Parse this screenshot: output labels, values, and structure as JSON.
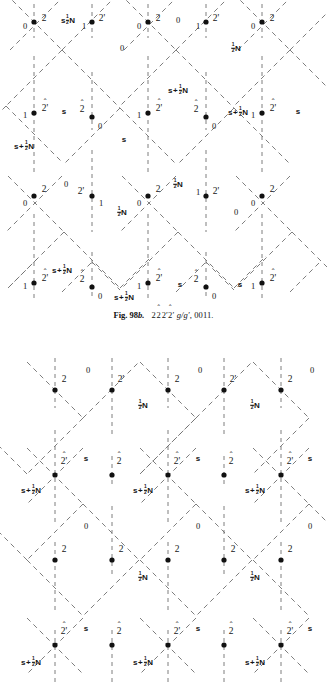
{
  "page": {
    "width": 327,
    "height": 682,
    "background": "#ffffff",
    "ink": "#141414",
    "line_color": "#6f6f6f"
  },
  "figures": [
    {
      "id": "fig-98b",
      "name": "upper-diagram",
      "origin_y": 0,
      "height": 300,
      "caption": {
        "fig_number": "Fig. 98b.",
        "symbol_1": "2",
        "symbol_2": "2",
        "symbol_2_hat": "^",
        "symbol_3": "2'",
        "symbol_4": "2'",
        "symbol_4_hat": "^",
        "glide": "g/g'",
        "indices": "0011",
        "full_text": "Fig. 98b.  2 2̂ 2' 2̂' g/g', 0011."
      },
      "columns_x": [
        34,
        92,
        148,
        206,
        262
      ],
      "rows_y": [
        22,
        113,
        196,
        283
      ],
      "nodes": [
        {
          "row": 0,
          "col": 0,
          "x": 34,
          "y": 22,
          "left_label": "0",
          "right_label": "2",
          "hat": false
        },
        {
          "row": 0,
          "col": 1,
          "x": 92,
          "y": 22,
          "left_label": "1",
          "right_label": "2'",
          "hat": false
        },
        {
          "row": 0,
          "col": 2,
          "x": 148,
          "y": 22,
          "left_label": "0",
          "right_label": "2",
          "hat": false
        },
        {
          "row": 0,
          "col": 3,
          "x": 206,
          "y": 22,
          "left_label": "1",
          "right_label": "2'",
          "hat": false
        },
        {
          "row": 0,
          "col": 4,
          "x": 262,
          "y": 22,
          "left_label": "0",
          "right_label": "2",
          "hat": false
        },
        {
          "row": 1,
          "col": 0,
          "x": 34,
          "y": 113,
          "left_label": "1",
          "right_label": "2'",
          "hat": true
        },
        {
          "row": 1,
          "col": 1,
          "x": 92,
          "y": 117,
          "left_label": "2",
          "right_label": "0",
          "hat": true,
          "flip": true
        },
        {
          "row": 1,
          "col": 2,
          "x": 148,
          "y": 113,
          "left_label": "1",
          "right_label": "2'",
          "hat": true
        },
        {
          "row": 1,
          "col": 3,
          "x": 206,
          "y": 117,
          "left_label": "2",
          "right_label": "0",
          "hat": true,
          "flip": true
        },
        {
          "row": 1,
          "col": 4,
          "x": 262,
          "y": 113,
          "left_label": "1",
          "right_label": "2'",
          "hat": true
        },
        {
          "row": 2,
          "col": 0,
          "x": 34,
          "y": 196,
          "left_label": "0",
          "right_label": "2",
          "hat": false
        },
        {
          "row": 2,
          "col": 1,
          "x": 92,
          "y": 196,
          "left_label": "2'",
          "right_label": "1",
          "hat": false,
          "flip": true
        },
        {
          "row": 2,
          "col": 2,
          "x": 148,
          "y": 196,
          "left_label": "0",
          "right_label": "2",
          "hat": false
        },
        {
          "row": 2,
          "col": 3,
          "x": 206,
          "y": 196,
          "left_label": "1",
          "right_label": "2'",
          "hat": false
        },
        {
          "row": 2,
          "col": 4,
          "x": 262,
          "y": 196,
          "left_label": "0",
          "right_label": "2",
          "hat": false
        },
        {
          "row": 3,
          "col": 0,
          "x": 34,
          "y": 283,
          "left_label": "1",
          "right_label": "2'",
          "hat": true
        },
        {
          "row": 3,
          "col": 1,
          "x": 92,
          "y": 287,
          "left_label": "2",
          "right_label": "0",
          "hat": true,
          "flip": true
        },
        {
          "row": 3,
          "col": 2,
          "x": 148,
          "y": 283,
          "left_label": "1",
          "right_label": "2'",
          "hat": true,
          "flip2": true
        },
        {
          "row": 3,
          "col": 3,
          "x": 206,
          "y": 287,
          "left_label": "2",
          "right_label": "0",
          "hat": true,
          "flip": true
        },
        {
          "row": 3,
          "col": 4,
          "x": 262,
          "y": 283,
          "left_label": "1",
          "right_label": "2'",
          "hat": true
        }
      ],
      "field_labels": [
        {
          "x": 68,
          "y": 20,
          "kind": "halfN",
          "text": "½N"
        },
        {
          "x": 122,
          "y": 48,
          "kind": "plain",
          "text": "0"
        },
        {
          "x": 178,
          "y": 20,
          "kind": "plain",
          "text": "0"
        },
        {
          "x": 236,
          "y": 48,
          "kind": "halfN",
          "text": "½N"
        },
        {
          "x": 64,
          "y": 112,
          "kind": "plain",
          "text": "s"
        },
        {
          "x": 124,
          "y": 140,
          "kind": "plain",
          "text": "s"
        },
        {
          "x": 178,
          "y": 90,
          "kind": "sHalfN",
          "text": "s+½N"
        },
        {
          "x": 22,
          "y": 146,
          "kind": "sHalfN",
          "text": "s+½N"
        },
        {
          "x": 238,
          "y": 112,
          "kind": "sHalfN",
          "text": "s+½N"
        },
        {
          "x": 296,
          "y": 112,
          "kind": "plain",
          "text": "s"
        },
        {
          "x": 66,
          "y": 184,
          "kind": "plain",
          "text": "0"
        },
        {
          "x": 122,
          "y": 212,
          "kind": "halfN",
          "text": "½N"
        },
        {
          "x": 178,
          "y": 184,
          "kind": "halfN",
          "text": "½N"
        },
        {
          "x": 236,
          "y": 212,
          "kind": "plain",
          "text": "0"
        },
        {
          "x": 60,
          "y": 270,
          "kind": "sHalfN",
          "text": "s+½N"
        },
        {
          "x": 122,
          "y": 297,
          "kind": "sHalfN",
          "text": "s+½N"
        },
        {
          "x": 178,
          "y": 285,
          "kind": "plain",
          "text": "s"
        },
        {
          "x": 240,
          "y": 285,
          "kind": "plain",
          "text": "s"
        }
      ]
    },
    {
      "id": "fig-lower",
      "name": "lower-diagram",
      "origin_y": 330,
      "height": 352,
      "columns_x": [
        55,
        112,
        168,
        224,
        281
      ],
      "rows_y": [
        390,
        475,
        560,
        645
      ],
      "nodes": [
        {
          "row": 0,
          "col": 0,
          "x": 55,
          "y": 390,
          "left_label": "",
          "right_label": "2",
          "hat": false,
          "above": true
        },
        {
          "row": 0,
          "col": 1,
          "x": 112,
          "y": 390,
          "left_label": "",
          "right_label": "2'",
          "hat": false,
          "above": true
        },
        {
          "row": 0,
          "col": 2,
          "x": 168,
          "y": 390,
          "left_label": "",
          "right_label": "2",
          "hat": false,
          "above": true
        },
        {
          "row": 0,
          "col": 3,
          "x": 224,
          "y": 390,
          "left_label": "",
          "right_label": "2'",
          "hat": false,
          "above": true
        },
        {
          "row": 0,
          "col": 4,
          "x": 281,
          "y": 390,
          "left_label": "",
          "right_label": "2",
          "hat": false,
          "above": true
        },
        {
          "row": 1,
          "col": 0,
          "x": 55,
          "y": 475,
          "left_label": "",
          "right_label": "2'",
          "hat": true,
          "above": true
        },
        {
          "row": 1,
          "col": 1,
          "x": 112,
          "y": 475,
          "left_label": "",
          "right_label": "2",
          "hat": true,
          "above": true
        },
        {
          "row": 1,
          "col": 2,
          "x": 168,
          "y": 475,
          "left_label": "",
          "right_label": "2'",
          "hat": true,
          "above": true
        },
        {
          "row": 1,
          "col": 3,
          "x": 224,
          "y": 475,
          "left_label": "",
          "right_label": "2",
          "hat": true,
          "above": true
        },
        {
          "row": 1,
          "col": 4,
          "x": 281,
          "y": 475,
          "left_label": "",
          "right_label": "2'",
          "hat": true,
          "above": true
        },
        {
          "row": 2,
          "col": 0,
          "x": 55,
          "y": 560,
          "left_label": "",
          "right_label": "2",
          "hat": false,
          "above": true
        },
        {
          "row": 2,
          "col": 1,
          "x": 112,
          "y": 560,
          "left_label": "",
          "right_label": "2",
          "hat": false,
          "above": true
        },
        {
          "row": 2,
          "col": 2,
          "x": 168,
          "y": 560,
          "left_label": "",
          "right_label": "2",
          "hat": false,
          "above": true
        },
        {
          "row": 2,
          "col": 3,
          "x": 224,
          "y": 560,
          "left_label": "",
          "right_label": "2",
          "hat": false,
          "above": true
        },
        {
          "row": 2,
          "col": 4,
          "x": 281,
          "y": 560,
          "left_label": "",
          "right_label": "2",
          "hat": false,
          "above": true
        },
        {
          "row": 3,
          "col": 0,
          "x": 55,
          "y": 645,
          "left_label": "",
          "right_label": "2'",
          "hat": true,
          "above": true
        },
        {
          "row": 3,
          "col": 1,
          "x": 112,
          "y": 645,
          "left_label": "",
          "right_label": "2",
          "hat": true,
          "above": true
        },
        {
          "row": 3,
          "col": 2,
          "x": 168,
          "y": 645,
          "left_label": "",
          "right_label": "2'",
          "hat": true,
          "above": true
        },
        {
          "row": 3,
          "col": 3,
          "x": 224,
          "y": 645,
          "left_label": "",
          "right_label": "2",
          "hat": true,
          "above": true
        },
        {
          "row": 3,
          "col": 4,
          "x": 281,
          "y": 645,
          "left_label": "",
          "right_label": "2'",
          "hat": true,
          "above": true
        }
      ],
      "field_labels": [
        {
          "x": 88,
          "y": 370,
          "kind": "plain",
          "text": "0"
        },
        {
          "x": 200,
          "y": 370,
          "kind": "plain",
          "text": "0"
        },
        {
          "x": 312,
          "y": 370,
          "kind": "plain",
          "text": "0"
        },
        {
          "x": 143,
          "y": 405,
          "kind": "halfN",
          "text": "½N"
        },
        {
          "x": 255,
          "y": 405,
          "kind": "halfN",
          "text": "½N"
        },
        {
          "x": 86,
          "y": 459,
          "kind": "plain",
          "text": "s"
        },
        {
          "x": 198,
          "y": 459,
          "kind": "plain",
          "text": "s"
        },
        {
          "x": 308,
          "y": 459,
          "kind": "plain",
          "text": "s"
        },
        {
          "x": 31,
          "y": 490,
          "kind": "sHalfN",
          "text": "s+½N"
        },
        {
          "x": 143,
          "y": 490,
          "kind": "sHalfN",
          "text": "s+½N"
        },
        {
          "x": 255,
          "y": 490,
          "kind": "sHalfN",
          "text": "s+½N"
        },
        {
          "x": 86,
          "y": 525,
          "kind": "plain",
          "text": "0"
        },
        {
          "x": 198,
          "y": 525,
          "kind": "plain",
          "text": "0"
        },
        {
          "x": 308,
          "y": 525,
          "kind": "plain",
          "text": "0"
        },
        {
          "x": 143,
          "y": 577,
          "kind": "halfN",
          "text": "½N"
        },
        {
          "x": 255,
          "y": 577,
          "kind": "halfN",
          "text": "½N"
        },
        {
          "x": 86,
          "y": 629,
          "kind": "plain",
          "text": "s"
        },
        {
          "x": 198,
          "y": 629,
          "kind": "plain",
          "text": "s"
        },
        {
          "x": 308,
          "y": 629,
          "kind": "plain",
          "text": "s"
        },
        {
          "x": 31,
          "y": 660,
          "kind": "sHalfN",
          "text": "s+½N"
        },
        {
          "x": 143,
          "y": 660,
          "kind": "sHalfN",
          "text": "s+½N"
        },
        {
          "x": 255,
          "y": 660,
          "kind": "sHalfN",
          "text": "s+½N"
        }
      ]
    }
  ],
  "caption_y": 312,
  "glyphs": {
    "hat": "ˆ",
    "prime": "′",
    "dot": "●"
  }
}
